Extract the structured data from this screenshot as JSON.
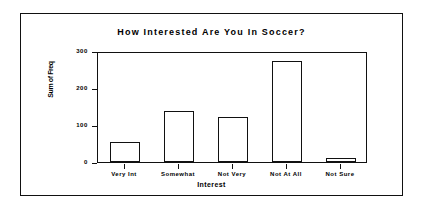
{
  "chart_data": {
    "type": "bar",
    "title": "How Interested Are You In Soccer?",
    "xlabel": "Interest",
    "ylabel": "Sum of Freq",
    "categories": [
      "Very Int",
      "Somewhat",
      "Not Very",
      "Not At All",
      "Not Sure"
    ],
    "values": [
      55,
      138,
      123,
      272,
      10
    ],
    "yticks": [
      "0",
      "100",
      "200",
      "300"
    ],
    "ytick_values": [
      0,
      100,
      200,
      300
    ],
    "ylim": [
      0,
      300
    ],
    "grid": false,
    "legend": false,
    "bar_fill": "#ffffff",
    "bar_outline": "#111111",
    "background": "#ffffff"
  }
}
